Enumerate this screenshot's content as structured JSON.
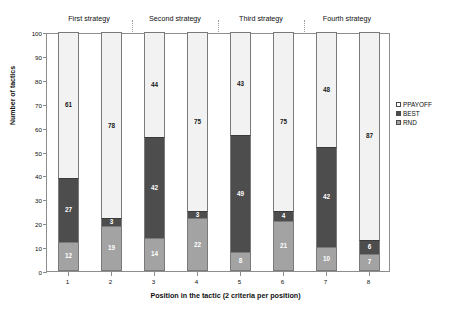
{
  "chart_data": {
    "type": "bar",
    "subtype": "stacked-bar",
    "title": "",
    "xlabel": "Position in the tactic (2 criteria per position)",
    "ylabel": "Number of tactics",
    "ylim": [
      0,
      100
    ],
    "yticks": [
      0,
      10,
      20,
      30,
      40,
      50,
      60,
      70,
      80,
      90,
      100
    ],
    "grid": false,
    "legend_position": "right",
    "categories": [
      "1",
      "2",
      "3",
      "4",
      "5",
      "6",
      "7",
      "8"
    ],
    "series": [
      {
        "name": "RND",
        "color": "#a3a3a3",
        "values": [
          12,
          19,
          14,
          22,
          8,
          21,
          10,
          7
        ]
      },
      {
        "name": "BEST",
        "color": "#4d4d4d",
        "values": [
          27,
          3,
          42,
          3,
          49,
          4,
          42,
          6
        ]
      },
      {
        "name": "PPAYOFF",
        "color": "#f2f2f2",
        "values": [
          61,
          78,
          44,
          75,
          43,
          75,
          48,
          87
        ]
      }
    ],
    "stack_order_bottom_to_top": [
      "RND",
      "BEST",
      "PPAYOFF"
    ],
    "groups": [
      {
        "label": "First strategy",
        "categories": [
          "1",
          "2"
        ]
      },
      {
        "label": "Second strategy",
        "categories": [
          "3",
          "4"
        ]
      },
      {
        "label": "Third strategy",
        "categories": [
          "5",
          "6"
        ]
      },
      {
        "label": "Fourth strategy",
        "categories": [
          "7",
          "8"
        ]
      }
    ]
  },
  "axes": {
    "y_title": "Number of tactics",
    "x_title": "Position in the tactic (2 criteria per position)",
    "y_tick_labels": [
      "0",
      "10",
      "20",
      "30",
      "40",
      "50",
      "60",
      "70",
      "80",
      "90",
      "100"
    ],
    "x_tick_labels": [
      "1",
      "2",
      "3",
      "4",
      "5",
      "6",
      "7",
      "8"
    ]
  },
  "groups": [
    {
      "label": "First strategy"
    },
    {
      "label": "Second strategy"
    },
    {
      "label": "Third strategy"
    },
    {
      "label": "Fourth strategy"
    }
  ],
  "legend": {
    "items": [
      {
        "label": "PPAYOFF",
        "color": "#ffffff"
      },
      {
        "label": "BEST",
        "color": "#4d4d4d"
      },
      {
        "label": "RND",
        "color": "#a3a3a3"
      }
    ]
  },
  "bar_labels": {
    "b1": {
      "rnd": "12",
      "best": "27",
      "ppayoff": "61"
    },
    "b2": {
      "rnd": "19",
      "best": "3",
      "ppayoff": "78"
    },
    "b3": {
      "rnd": "14",
      "best": "42",
      "ppayoff": "44"
    },
    "b4": {
      "rnd": "22",
      "best": "3",
      "ppayoff": "75"
    },
    "b5": {
      "rnd": "8",
      "best": "49",
      "ppayoff": "43"
    },
    "b6": {
      "rnd": "21",
      "best": "4",
      "ppayoff": "75"
    },
    "b7": {
      "rnd": "10",
      "best": "42",
      "ppayoff": "48"
    },
    "b8": {
      "rnd": "7",
      "best": "6",
      "ppayoff": "87"
    }
  }
}
